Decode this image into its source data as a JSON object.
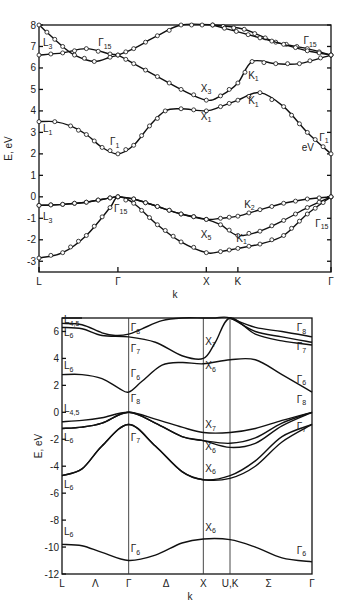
{
  "chart_data": [
    {
      "type": "line",
      "title": "",
      "xlabel": "k",
      "ylabel": "E, eV",
      "ylim": [
        -3.5,
        8
      ],
      "yticks": [
        8,
        7,
        6,
        5,
        4,
        3,
        2,
        1,
        0,
        -1,
        -2,
        -3
      ],
      "markers": true,
      "kpoints": [
        {
          "label": "L",
          "x": 0
        },
        {
          "label": "Γ",
          "x": 1
        },
        {
          "label": "X",
          "x": 2.12
        },
        {
          "label": "K",
          "x": 2.52
        },
        {
          "label": "Γ",
          "x": 3.7
        }
      ],
      "series": [
        {
          "name": "valence-1",
          "x": [
            0,
            0.3,
            0.6,
            0.9,
            1.0,
            1.2,
            1.5,
            1.8,
            2.12,
            2.3,
            2.52,
            2.8,
            3.1,
            3.4,
            3.7
          ],
          "y": [
            -2.85,
            -2.6,
            -1.8,
            -0.5,
            0.0,
            -0.3,
            -1.3,
            -2.1,
            -2.6,
            -2.55,
            -2.4,
            -2.2,
            -1.8,
            -0.8,
            0.0
          ]
        },
        {
          "name": "valence-2",
          "x": [
            0,
            0.3,
            0.6,
            0.9,
            1.0,
            1.2,
            1.5,
            1.8,
            2.12,
            2.3,
            2.52,
            2.8,
            3.1,
            3.4,
            3.7
          ],
          "y": [
            -0.4,
            -0.35,
            -0.25,
            -0.05,
            0.0,
            -0.1,
            -0.45,
            -0.8,
            -1.05,
            -1.3,
            -1.8,
            -1.6,
            -1.1,
            -0.5,
            0.0
          ]
        },
        {
          "name": "valence-3",
          "x": [
            0,
            0.3,
            0.6,
            0.9,
            1.0,
            1.2,
            1.5,
            1.8,
            2.12,
            2.3,
            2.52,
            2.8,
            3.1,
            3.4,
            3.7
          ],
          "y": [
            -0.4,
            -0.35,
            -0.25,
            -0.05,
            0.0,
            -0.1,
            -0.45,
            -0.8,
            -1.05,
            -1.0,
            -0.9,
            -0.6,
            -0.3,
            -0.1,
            0.0
          ]
        },
        {
          "name": "conduction-1",
          "x": [
            0,
            0.2,
            0.4,
            0.6,
            0.8,
            1.0,
            1.2,
            1.4,
            1.6,
            1.8,
            2.12,
            2.3,
            2.52,
            2.8,
            3.1,
            3.4,
            3.7
          ],
          "y": [
            3.5,
            3.5,
            3.3,
            2.9,
            2.3,
            2.0,
            2.4,
            3.3,
            4.0,
            4.1,
            4.0,
            4.2,
            4.5,
            4.85,
            4.2,
            3.0,
            2.0
          ]
        },
        {
          "name": "conduction-2",
          "x": [
            0,
            0.3,
            0.6,
            0.9,
            1.0,
            1.2,
            1.5,
            1.8,
            2.12,
            2.3,
            2.52,
            2.7,
            3.0,
            3.3,
            3.7
          ],
          "y": [
            6.6,
            6.7,
            6.9,
            6.65,
            6.6,
            6.2,
            5.6,
            5.0,
            4.5,
            4.7,
            5.3,
            6.3,
            6.2,
            6.2,
            6.6
          ]
        },
        {
          "name": "conduction-3",
          "x": [
            0,
            0.3,
            0.45,
            0.7,
            0.9,
            1.0,
            1.2,
            1.5,
            1.8,
            2.2,
            2.6,
            3.0,
            3.4,
            3.7
          ],
          "y": [
            8.0,
            7.0,
            6.6,
            6.3,
            6.5,
            6.6,
            6.9,
            7.5,
            8.0,
            8.0,
            7.8,
            7.2,
            6.9,
            6.6
          ]
        },
        {
          "name": "conduction-4",
          "x": [
            2.2,
            2.5,
            2.8,
            3.1,
            3.4,
            3.7
          ],
          "y": [
            8.0,
            7.7,
            7.4,
            7.1,
            6.8,
            6.6
          ]
        }
      ],
      "annotations": [
        {
          "text": "L",
          "sub": "3",
          "x": 0.05,
          "y": 7.0
        },
        {
          "text": "Γ",
          "sub": "15",
          "x": 0.75,
          "y": 7.0
        },
        {
          "text": "Γ",
          "sub": "15",
          "x": 3.35,
          "y": 7.1
        },
        {
          "text": "X",
          "sub": "3",
          "x": 2.05,
          "y": 4.9
        },
        {
          "text": "K",
          "sub": "1",
          "x": 2.65,
          "y": 5.5
        },
        {
          "text": "X",
          "sub": "1",
          "x": 2.05,
          "y": 3.6
        },
        {
          "text": "K",
          "sub": "1",
          "x": 2.65,
          "y": 4.3
        },
        {
          "text": "L",
          "sub": "1",
          "x": 0.05,
          "y": 3.0
        },
        {
          "text": "Γ",
          "sub": "1",
          "x": 0.9,
          "y": 2.4
        },
        {
          "text": "Γ",
          "sub": "1",
          "x": 3.55,
          "y": 2.6
        },
        {
          "text": "eV",
          "sub": "",
          "x": 3.33,
          "y": 2.15
        },
        {
          "text": "K",
          "sub": "2",
          "x": 2.6,
          "y": -0.5
        },
        {
          "text": "L",
          "sub": "3",
          "x": 0.05,
          "y": -1.1
        },
        {
          "text": "Γ",
          "sub": "15",
          "x": 0.95,
          "y": -0.7
        },
        {
          "text": "X",
          "sub": "5",
          "x": 2.05,
          "y": -1.9
        },
        {
          "text": "K",
          "sub": "1",
          "x": 2.5,
          "y": -2.1
        },
        {
          "text": "Γ",
          "sub": "15",
          "x": 3.5,
          "y": -1.4
        }
      ]
    },
    {
      "type": "line",
      "title": "",
      "xlabel": "k",
      "ylabel": "E, eV",
      "ylim": [
        -12,
        7
      ],
      "yticks": [
        6,
        4,
        2,
        0,
        -2,
        -4,
        -6,
        -8,
        -10,
        -12
      ],
      "markers": false,
      "kpoints": [
        {
          "label": "L",
          "x": 0
        },
        {
          "label": "Γ",
          "x": 1
        },
        {
          "label": "X",
          "x": 2.12
        },
        {
          "label": "U,K",
          "x": 2.52
        },
        {
          "label": "Γ",
          "x": 3.75
        }
      ],
      "direction_labels": [
        {
          "label": "Λ",
          "x": 0.5
        },
        {
          "label": "Δ",
          "x": 1.56
        },
        {
          "label": "Σ",
          "x": 3.1
        }
      ],
      "series": [
        {
          "name": "band-s",
          "x": [
            0,
            0.3,
            0.6,
            1.0,
            1.4,
            1.8,
            2.12,
            2.52,
            2.9,
            3.3,
            3.75
          ],
          "y": [
            -9.8,
            -9.9,
            -10.4,
            -11.0,
            -10.6,
            -9.7,
            -9.4,
            -9.45,
            -10.0,
            -10.8,
            -11.1
          ]
        },
        {
          "name": "band-p1",
          "x": [
            0,
            0.3,
            0.6,
            1.0,
            1.4,
            1.8,
            2.12,
            2.52,
            2.9,
            3.3,
            3.75
          ],
          "y": [
            -4.7,
            -4.2,
            -2.5,
            -0.9,
            -2.5,
            -4.4,
            -5.0,
            -4.9,
            -4.0,
            -2.2,
            -0.9
          ]
        },
        {
          "name": "band-p2",
          "x": [
            0,
            0.3,
            0.6,
            1.0,
            1.4,
            1.8,
            2.12,
            2.52,
            2.9,
            3.3,
            3.75
          ],
          "y": [
            -4.7,
            -4.2,
            -2.5,
            -0.9,
            -2.5,
            -4.4,
            -5.0,
            -4.7,
            -3.6,
            -1.8,
            -0.9
          ]
        },
        {
          "name": "band-v1",
          "x": [
            0,
            0.3,
            0.6,
            1.0,
            1.4,
            1.8,
            2.12,
            2.52,
            2.9,
            3.3,
            3.75
          ],
          "y": [
            -1.2,
            -1.1,
            -0.8,
            0.0,
            -0.8,
            -1.8,
            -2.1,
            -2.6,
            -2.3,
            -1.0,
            0.0
          ]
        },
        {
          "name": "band-v2",
          "x": [
            0,
            0.3,
            0.6,
            1.0,
            1.4,
            1.8,
            2.12,
            2.52,
            2.9,
            3.3,
            3.75
          ],
          "y": [
            -0.7,
            -0.6,
            -0.4,
            0.0,
            -0.5,
            -1.1,
            -1.5,
            -1.5,
            -1.2,
            -0.6,
            0.0
          ]
        },
        {
          "name": "band-v3",
          "x": [
            0,
            0.3,
            0.6,
            1.0,
            1.4,
            1.8,
            2.12,
            2.52,
            2.9,
            3.3,
            3.75
          ],
          "y": [
            -1.2,
            -1.1,
            -0.8,
            0.0,
            -0.8,
            -1.8,
            -2.1,
            -2.3,
            -1.9,
            -0.8,
            0.0
          ]
        },
        {
          "name": "band-c1",
          "x": [
            0,
            0.3,
            0.6,
            0.85,
            1.0,
            1.2,
            1.5,
            1.8,
            2.12,
            2.52,
            2.9,
            3.3,
            3.75
          ],
          "y": [
            2.8,
            2.8,
            2.5,
            1.8,
            1.5,
            2.3,
            3.5,
            3.7,
            3.6,
            3.9,
            3.9,
            2.8,
            1.5
          ]
        },
        {
          "name": "band-c2",
          "x": [
            0,
            0.3,
            0.6,
            1.0,
            1.4,
            1.8,
            2.12,
            2.3,
            2.52,
            2.9,
            3.3,
            3.75
          ],
          "y": [
            6.3,
            6.2,
            5.7,
            5.6,
            5.2,
            4.2,
            4.0,
            5.2,
            7.0,
            5.8,
            5.3,
            5.0
          ]
        },
        {
          "name": "band-c3",
          "x": [
            0,
            0.3,
            0.6,
            0.8,
            1.0,
            1.2,
            1.5,
            1.8,
            2.12,
            2.3,
            2.52,
            2.9,
            3.3,
            3.75
          ],
          "y": [
            6.6,
            6.5,
            5.9,
            5.7,
            5.8,
            6.2,
            6.8,
            7.0,
            7.0,
            7.0,
            7.0,
            6.0,
            5.6,
            5.2
          ]
        },
        {
          "name": "band-c4",
          "x": [
            0,
            0.15,
            0.3
          ],
          "y": [
            7.0,
            7.0,
            7.0
          ]
        },
        {
          "name": "band-c5",
          "x": [
            2.52,
            2.9,
            3.3,
            3.75
          ],
          "y": [
            7.0,
            6.3,
            6.0,
            5.6
          ]
        }
      ],
      "annotations": [
        {
          "text": "L",
          "sub": "4,5",
          "x": 0.03,
          "y": 6.6
        },
        {
          "text": "L",
          "sub": "6",
          "x": 0.03,
          "y": 5.7
        },
        {
          "text": "L",
          "sub": "6",
          "x": 0.03,
          "y": 3.2
        },
        {
          "text": "L",
          "sub": "4,5",
          "x": 0.03,
          "y": 0.0
        },
        {
          "text": "L",
          "sub": "6",
          "x": 0.03,
          "y": -2.1
        },
        {
          "text": "L",
          "sub": "6",
          "x": 0.03,
          "y": -5.6
        },
        {
          "text": "L",
          "sub": "6",
          "x": 0.03,
          "y": -9.1
        },
        {
          "text": "Γ",
          "sub": "8",
          "x": 1.03,
          "y": 6.0
        },
        {
          "text": "Γ",
          "sub": "7",
          "x": 1.03,
          "y": 4.5
        },
        {
          "text": "Γ",
          "sub": "6",
          "x": 1.03,
          "y": 2.6
        },
        {
          "text": "Γ",
          "sub": "8",
          "x": 1.03,
          "y": 0.8
        },
        {
          "text": "Γ",
          "sub": "7",
          "x": 1.03,
          "y": -2.1
        },
        {
          "text": "Γ",
          "sub": "6",
          "x": 1.03,
          "y": -10.4
        },
        {
          "text": "X",
          "sub": "7",
          "x": 2.15,
          "y": 5.0
        },
        {
          "text": "X",
          "sub": "6",
          "x": 2.15,
          "y": 3.2
        },
        {
          "text": "X",
          "sub": "7",
          "x": 2.15,
          "y": -1.2
        },
        {
          "text": "X",
          "sub": "6",
          "x": 2.15,
          "y": -2.8
        },
        {
          "text": "X",
          "sub": "6",
          "x": 2.15,
          "y": -4.4
        },
        {
          "text": "X",
          "sub": "6",
          "x": 2.15,
          "y": -8.8
        },
        {
          "text": "Γ",
          "sub": "8",
          "x": 3.52,
          "y": 6.0
        },
        {
          "text": "Γ",
          "sub": "7",
          "x": 3.52,
          "y": 4.6
        },
        {
          "text": "Γ",
          "sub": "6",
          "x": 3.52,
          "y": 2.2
        },
        {
          "text": "Γ",
          "sub": "8",
          "x": 3.52,
          "y": 0.7
        },
        {
          "text": "Γ",
          "sub": "7",
          "x": 3.52,
          "y": -1.3
        },
        {
          "text": "Γ",
          "sub": "6",
          "x": 3.52,
          "y": -10.5
        }
      ]
    }
  ]
}
